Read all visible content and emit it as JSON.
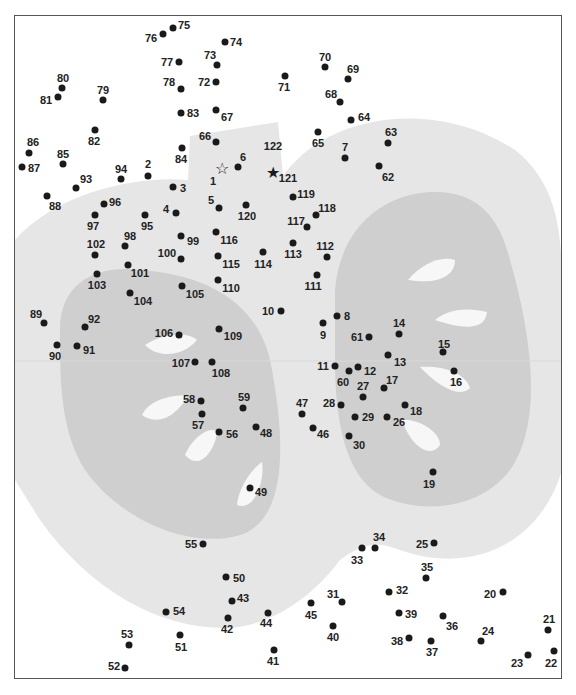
{
  "puzzle": {
    "title": "Connect the dots",
    "start_marker": "☆",
    "end_marker": "★",
    "colors": {
      "frame": "#555555",
      "apple_light": "#e6e6e6",
      "apple_core": "#cfcfcf",
      "seed": "#f7f7f7",
      "dot": "#1a1a1a",
      "label": "#222222"
    },
    "points": [
      {
        "n": "1",
        "x": 222,
        "y": 169,
        "lx": 213,
        "ly": 181,
        "marker": "start"
      },
      {
        "n": "2",
        "x": 148,
        "y": 176,
        "lx": 148,
        "ly": 164
      },
      {
        "n": "3",
        "x": 173,
        "y": 187,
        "lx": 183,
        "ly": 188
      },
      {
        "n": "4",
        "x": 176,
        "y": 213,
        "lx": 166,
        "ly": 209
      },
      {
        "n": "5",
        "x": 219,
        "y": 208,
        "lx": 211,
        "ly": 200
      },
      {
        "n": "6",
        "x": 238,
        "y": 167,
        "lx": 243,
        "ly": 157
      },
      {
        "n": "7",
        "x": 345,
        "y": 158,
        "lx": 345,
        "ly": 147
      },
      {
        "n": "8",
        "x": 337,
        "y": 316,
        "lx": 347,
        "ly": 316
      },
      {
        "n": "9",
        "x": 323,
        "y": 323,
        "lx": 323,
        "ly": 335
      },
      {
        "n": "10",
        "x": 281,
        "y": 311,
        "lx": 268,
        "ly": 311
      },
      {
        "n": "11",
        "x": 335,
        "y": 366,
        "lx": 323,
        "ly": 366
      },
      {
        "n": "12",
        "x": 358,
        "y": 367,
        "lx": 370,
        "ly": 371
      },
      {
        "n": "13",
        "x": 388,
        "y": 355,
        "lx": 400,
        "ly": 362
      },
      {
        "n": "14",
        "x": 399,
        "y": 334,
        "lx": 399,
        "ly": 323
      },
      {
        "n": "15",
        "x": 443,
        "y": 352,
        "lx": 444,
        "ly": 344
      },
      {
        "n": "16",
        "x": 454,
        "y": 371,
        "lx": 456,
        "ly": 382
      },
      {
        "n": "17",
        "x": 384,
        "y": 388,
        "lx": 392,
        "ly": 380
      },
      {
        "n": "18",
        "x": 405,
        "y": 405,
        "lx": 416,
        "ly": 411
      },
      {
        "n": "19",
        "x": 433,
        "y": 472,
        "lx": 429,
        "ly": 484
      },
      {
        "n": "20",
        "x": 503,
        "y": 592,
        "lx": 490,
        "ly": 594
      },
      {
        "n": "21",
        "x": 548,
        "y": 630,
        "lx": 549,
        "ly": 619
      },
      {
        "n": "22",
        "x": 554,
        "y": 651,
        "lx": 551,
        "ly": 663
      },
      {
        "n": "23",
        "x": 528,
        "y": 655,
        "lx": 517,
        "ly": 663
      },
      {
        "n": "24",
        "x": 481,
        "y": 641,
        "lx": 488,
        "ly": 631
      },
      {
        "n": "25",
        "x": 434,
        "y": 543,
        "lx": 422,
        "ly": 544
      },
      {
        "n": "26",
        "x": 387,
        "y": 417,
        "lx": 399,
        "ly": 422
      },
      {
        "n": "27",
        "x": 363,
        "y": 397,
        "lx": 363,
        "ly": 386
      },
      {
        "n": "28",
        "x": 341,
        "y": 405,
        "lx": 329,
        "ly": 403
      },
      {
        "n": "29",
        "x": 355,
        "y": 417,
        "lx": 368,
        "ly": 417
      },
      {
        "n": "30",
        "x": 349,
        "y": 436,
        "lx": 359,
        "ly": 445
      },
      {
        "n": "31",
        "x": 342,
        "y": 602,
        "lx": 333,
        "ly": 594
      },
      {
        "n": "32",
        "x": 389,
        "y": 592,
        "lx": 402,
        "ly": 590
      },
      {
        "n": "33",
        "x": 362,
        "y": 548,
        "lx": 357,
        "ly": 560
      },
      {
        "n": "34",
        "x": 375,
        "y": 548,
        "lx": 379,
        "ly": 537
      },
      {
        "n": "35",
        "x": 426,
        "y": 578,
        "lx": 427,
        "ly": 567
      },
      {
        "n": "36",
        "x": 443,
        "y": 616,
        "lx": 452,
        "ly": 626
      },
      {
        "n": "37",
        "x": 431,
        "y": 641,
        "lx": 432,
        "ly": 652
      },
      {
        "n": "38",
        "x": 409,
        "y": 638,
        "lx": 397,
        "ly": 641
      },
      {
        "n": "39",
        "x": 399,
        "y": 613,
        "lx": 411,
        "ly": 614
      },
      {
        "n": "40",
        "x": 333,
        "y": 626,
        "lx": 333,
        "ly": 637
      },
      {
        "n": "41",
        "x": 274,
        "y": 650,
        "lx": 273,
        "ly": 661
      },
      {
        "n": "42",
        "x": 228,
        "y": 618,
        "lx": 227,
        "ly": 629
      },
      {
        "n": "43",
        "x": 232,
        "y": 601,
        "lx": 243,
        "ly": 598
      },
      {
        "n": "44",
        "x": 268,
        "y": 613,
        "lx": 266,
        "ly": 623
      },
      {
        "n": "45",
        "x": 311,
        "y": 603,
        "lx": 311,
        "ly": 615
      },
      {
        "n": "46",
        "x": 313,
        "y": 428,
        "lx": 323,
        "ly": 434
      },
      {
        "n": "47",
        "x": 302,
        "y": 414,
        "lx": 302,
        "ly": 403
      },
      {
        "n": "48",
        "x": 256,
        "y": 427,
        "lx": 266,
        "ly": 433
      },
      {
        "n": "49",
        "x": 250,
        "y": 488,
        "lx": 261,
        "ly": 492
      },
      {
        "n": "50",
        "x": 226,
        "y": 577,
        "lx": 239,
        "ly": 578
      },
      {
        "n": "51",
        "x": 180,
        "y": 635,
        "lx": 181,
        "ly": 647
      },
      {
        "n": "52",
        "x": 125,
        "y": 668,
        "lx": 114,
        "ly": 666
      },
      {
        "n": "53",
        "x": 129,
        "y": 645,
        "lx": 127,
        "ly": 634
      },
      {
        "n": "54",
        "x": 166,
        "y": 612,
        "lx": 179,
        "ly": 611
      },
      {
        "n": "55",
        "x": 203,
        "y": 544,
        "lx": 191,
        "ly": 544
      },
      {
        "n": "56",
        "x": 219,
        "y": 432,
        "lx": 232,
        "ly": 434
      },
      {
        "n": "57",
        "x": 202,
        "y": 414,
        "lx": 198,
        "ly": 425
      },
      {
        "n": "58",
        "x": 201,
        "y": 401,
        "lx": 189,
        "ly": 399
      },
      {
        "n": "59",
        "x": 243,
        "y": 408,
        "lx": 244,
        "ly": 397
      },
      {
        "n": "60",
        "x": 349,
        "y": 371,
        "lx": 343,
        "ly": 382
      },
      {
        "n": "61",
        "x": 369,
        "y": 337,
        "lx": 357,
        "ly": 337
      },
      {
        "n": "62",
        "x": 379,
        "y": 166,
        "lx": 388,
        "ly": 177
      },
      {
        "n": "63",
        "x": 388,
        "y": 143,
        "lx": 391,
        "ly": 132
      },
      {
        "n": "64",
        "x": 351,
        "y": 120,
        "lx": 364,
        "ly": 117
      },
      {
        "n": "65",
        "x": 318,
        "y": 132,
        "lx": 318,
        "ly": 143
      },
      {
        "n": "66",
        "x": 216,
        "y": 142,
        "lx": 205,
        "ly": 136
      },
      {
        "n": "67",
        "x": 216,
        "y": 110,
        "lx": 227,
        "ly": 117
      },
      {
        "n": "68",
        "x": 340,
        "y": 102,
        "lx": 331,
        "ly": 94
      },
      {
        "n": "69",
        "x": 348,
        "y": 79,
        "lx": 353,
        "ly": 69
      },
      {
        "n": "70",
        "x": 325,
        "y": 67,
        "lx": 325,
        "ly": 57
      },
      {
        "n": "71",
        "x": 285,
        "y": 76,
        "lx": 284,
        "ly": 87
      },
      {
        "n": "72",
        "x": 216,
        "y": 82,
        "lx": 204,
        "ly": 82
      },
      {
        "n": "73",
        "x": 217,
        "y": 65,
        "lx": 210,
        "ly": 55
      },
      {
        "n": "74",
        "x": 225,
        "y": 42,
        "lx": 236,
        "ly": 42
      },
      {
        "n": "75",
        "x": 173,
        "y": 28,
        "lx": 184,
        "ly": 25
      },
      {
        "n": "76",
        "x": 163,
        "y": 34,
        "lx": 151,
        "ly": 38
      },
      {
        "n": "77",
        "x": 179,
        "y": 62,
        "lx": 167,
        "ly": 62
      },
      {
        "n": "78",
        "x": 181,
        "y": 89,
        "lx": 169,
        "ly": 82
      },
      {
        "n": "79",
        "x": 103,
        "y": 100,
        "lx": 103,
        "ly": 90
      },
      {
        "n": "80",
        "x": 62,
        "y": 88,
        "lx": 63,
        "ly": 78
      },
      {
        "n": "81",
        "x": 58,
        "y": 97,
        "lx": 46,
        "ly": 100
      },
      {
        "n": "82",
        "x": 95,
        "y": 130,
        "lx": 94,
        "ly": 141
      },
      {
        "n": "83",
        "x": 181,
        "y": 113,
        "lx": 193,
        "ly": 113
      },
      {
        "n": "84",
        "x": 182,
        "y": 148,
        "lx": 181,
        "ly": 159
      },
      {
        "n": "85",
        "x": 63,
        "y": 164,
        "lx": 63,
        "ly": 154
      },
      {
        "n": "86",
        "x": 29,
        "y": 153,
        "lx": 33,
        "ly": 142
      },
      {
        "n": "87",
        "x": 22,
        "y": 167,
        "lx": 34,
        "ly": 168
      },
      {
        "n": "88",
        "x": 47,
        "y": 196,
        "lx": 55,
        "ly": 206
      },
      {
        "n": "89",
        "x": 44,
        "y": 323,
        "lx": 36,
        "ly": 314
      },
      {
        "n": "90",
        "x": 57,
        "y": 345,
        "lx": 55,
        "ly": 356
      },
      {
        "n": "91",
        "x": 77,
        "y": 346,
        "lx": 89,
        "ly": 350
      },
      {
        "n": "92",
        "x": 85,
        "y": 327,
        "lx": 94,
        "ly": 319
      },
      {
        "n": "93",
        "x": 76,
        "y": 188,
        "lx": 86,
        "ly": 179
      },
      {
        "n": "94",
        "x": 121,
        "y": 179,
        "lx": 121,
        "ly": 169
      },
      {
        "n": "95",
        "x": 145,
        "y": 215,
        "lx": 147,
        "ly": 226
      },
      {
        "n": "96",
        "x": 104,
        "y": 204,
        "lx": 115,
        "ly": 202
      },
      {
        "n": "97",
        "x": 95,
        "y": 215,
        "lx": 93,
        "ly": 226
      },
      {
        "n": "98",
        "x": 125,
        "y": 246,
        "lx": 130,
        "ly": 236
      },
      {
        "n": "99",
        "x": 181,
        "y": 236,
        "lx": 193,
        "ly": 241
      },
      {
        "n": "100",
        "x": 181,
        "y": 259,
        "lx": 167,
        "ly": 253
      },
      {
        "n": "101",
        "x": 128,
        "y": 265,
        "lx": 140,
        "ly": 273
      },
      {
        "n": "102",
        "x": 95,
        "y": 255,
        "lx": 96,
        "ly": 244
      },
      {
        "n": "103",
        "x": 97,
        "y": 274,
        "lx": 97,
        "ly": 285
      },
      {
        "n": "104",
        "x": 130,
        "y": 293,
        "lx": 143,
        "ly": 301
      },
      {
        "n": "105",
        "x": 182,
        "y": 286,
        "lx": 195,
        "ly": 294
      },
      {
        "n": "106",
        "x": 179,
        "y": 335,
        "lx": 164,
        "ly": 333
      },
      {
        "n": "107",
        "x": 195,
        "y": 362,
        "lx": 181,
        "ly": 363
      },
      {
        "n": "108",
        "x": 212,
        "y": 362,
        "lx": 221,
        "ly": 373
      },
      {
        "n": "109",
        "x": 219,
        "y": 329,
        "lx": 233,
        "ly": 336
      },
      {
        "n": "110",
        "x": 218,
        "y": 280,
        "lx": 231,
        "ly": 288
      },
      {
        "n": "111",
        "x": 317,
        "y": 275,
        "lx": 313,
        "ly": 286
      },
      {
        "n": "112",
        "x": 327,
        "y": 257,
        "lx": 325,
        "ly": 246
      },
      {
        "n": "113",
        "x": 293,
        "y": 243,
        "lx": 293,
        "ly": 254
      },
      {
        "n": "114",
        "x": 263,
        "y": 252,
        "lx": 263,
        "ly": 264
      },
      {
        "n": "115",
        "x": 218,
        "y": 256,
        "lx": 231,
        "ly": 264
      },
      {
        "n": "116",
        "x": 216,
        "y": 232,
        "lx": 229,
        "ly": 240
      },
      {
        "n": "117",
        "x": 307,
        "y": 227,
        "lx": 296,
        "ly": 221
      },
      {
        "n": "118",
        "x": 316,
        "y": 215,
        "lx": 327,
        "ly": 208
      },
      {
        "n": "119",
        "x": 293,
        "y": 197,
        "lx": 306,
        "ly": 194
      },
      {
        "n": "120",
        "x": 246,
        "y": 205,
        "lx": 247,
        "ly": 216
      },
      {
        "n": "121",
        "x": 273,
        "y": 173,
        "lx": 288,
        "ly": 178,
        "marker": "end"
      },
      {
        "n": "122",
        "x": null,
        "y": null,
        "lx": 273,
        "ly": 146
      }
    ]
  }
}
